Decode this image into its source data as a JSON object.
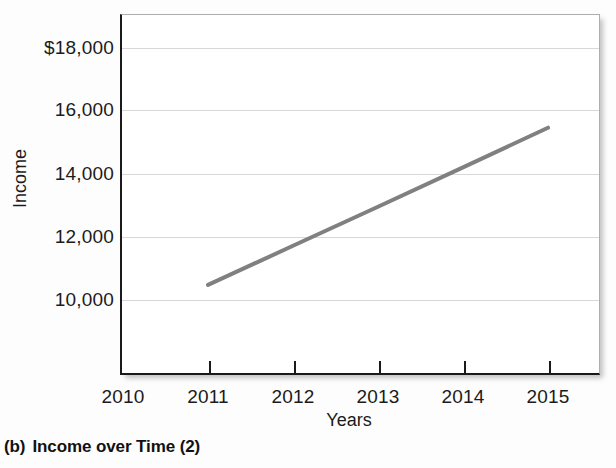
{
  "caption": {
    "marker": "(b)",
    "text": "Income over Time (2)"
  },
  "chart_data": {
    "type": "line",
    "title": "",
    "xlabel": "Years",
    "ylabel": "Income",
    "x": [
      2011,
      2012,
      2013,
      2014,
      2015
    ],
    "values": [
      10480,
      11720,
      12960,
      14210,
      15470
    ],
    "series": [
      {
        "name": "Income",
        "values": [
          10480,
          11720,
          12960,
          14210,
          15470
        ],
        "color": "#808080"
      }
    ],
    "x_tick_labels": [
      "2010",
      "2011",
      "2012",
      "2013",
      "2014",
      "2015"
    ],
    "x_ticks": [
      2010,
      2011,
      2012,
      2013,
      2014,
      2015
    ],
    "y_tick_labels": [
      "$18,000",
      "16,000",
      "14,000",
      "12,000",
      "10,000"
    ],
    "y_ticks": [
      18000,
      16000,
      14000,
      12000,
      10000
    ],
    "xlim": [
      2010,
      2015.6
    ],
    "ylim": [
      8500,
      18800
    ],
    "grid": "horizontal",
    "legend": "none",
    "line_color": "#808080",
    "line_width": 4
  }
}
